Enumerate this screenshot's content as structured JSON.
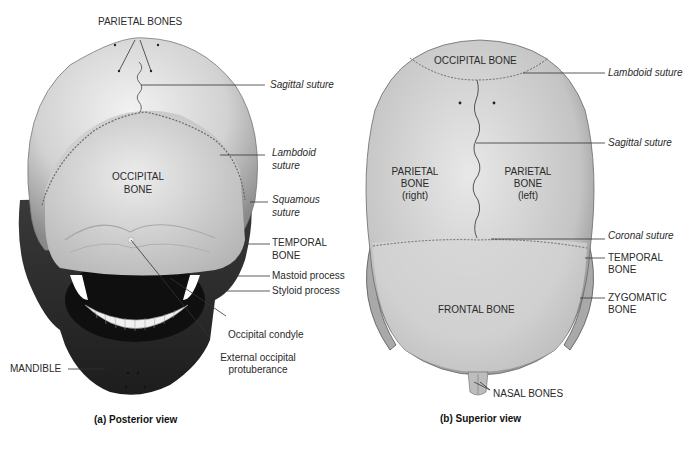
{
  "panels": [
    {
      "id": "posterior",
      "caption": "(a) Posterior view",
      "labels": {
        "parietal_bones": "PARIETAL BONES",
        "sagittal_suture": "Sagittal suture",
        "lambdoid_suture_1": "Lambdoid",
        "lambdoid_suture_2": "suture",
        "occipital_bone_1": "OCCIPITAL",
        "occipital_bone_2": "BONE",
        "squamous_suture_1": "Squamous",
        "squamous_suture_2": "suture",
        "temporal_bone_1": "TEMPORAL",
        "temporal_bone_2": "BONE",
        "mastoid_process": "Mastoid process",
        "styloid_process": "Styloid process",
        "occipital_condyle": "Occipital condyle",
        "external_occipital_protuberance_1": "External occipital",
        "external_occipital_protuberance_2": "protuberance",
        "mandible": "MANDIBLE"
      }
    },
    {
      "id": "superior",
      "caption": "(b) Superior view",
      "labels": {
        "occipital_bone": "OCCIPITAL BONE",
        "lambdoid_suture": "Lambdoid suture",
        "sagittal_suture": "Sagittal suture",
        "parietal_right_1": "PARIETAL",
        "parietal_right_2": "BONE",
        "parietal_right_3": "(right)",
        "parietal_left_1": "PARIETAL",
        "parietal_left_2": "BONE",
        "parietal_left_3": "(left)",
        "coronal_suture": "Coronal suture",
        "temporal_bone_1": "TEMPORAL",
        "temporal_bone_2": "BONE",
        "frontal_bone": "FRONTAL BONE",
        "zygomatic_bone_1": "ZYGOMATIC",
        "zygomatic_bone_2": "BONE",
        "nasal_bones": "NASAL BONES"
      }
    }
  ],
  "colors": {
    "bone_light": "#e6e6e6",
    "bone_mid": "#bdbdbd",
    "bone_dark": "#5a5a5a",
    "leader_line": "#333333"
  }
}
